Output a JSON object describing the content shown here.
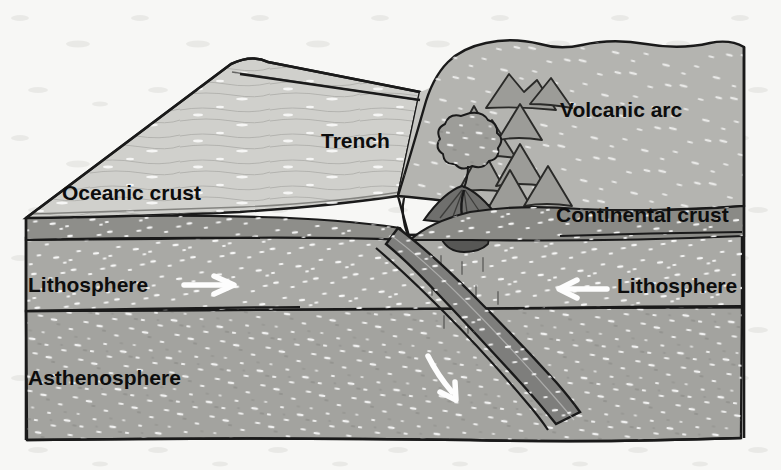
{
  "figure": {
    "background_color": "#f7f7f5"
  },
  "palette": {
    "paper": "#f7f7f5",
    "ocean_water": "#d9d9d6",
    "oceanic_top": "#bdbdb9",
    "oceanic_crust_band": "#8e8e8a",
    "lithosphere": "#a9a9a5",
    "asthenosphere": "#a3a39f",
    "continental_top": "#b2b2ae",
    "continental_crust_band": "#8a8a86",
    "slab_band": "#828280",
    "mountain_fill": "#9c9c98",
    "volcano_cone": "#6e6e6c",
    "magma_chamber": "#565654",
    "ash_plume": "#9a9a96",
    "outline": "#1a1a1a",
    "arrow_white": "#fdfdfd",
    "label_text": "#0d0d0d"
  },
  "labels": [
    {
      "id": "oceanic-crust",
      "text": "Oceanic crust",
      "x": 62,
      "y": 200,
      "size": 21
    },
    {
      "id": "trench",
      "text": "Trench",
      "x": 321,
      "y": 148,
      "size": 21
    },
    {
      "id": "volcanic-arc",
      "text": "Volcanic arc",
      "x": 560,
      "y": 117,
      "size": 21
    },
    {
      "id": "continental-crust",
      "text": "Continental crust",
      "x": 556,
      "y": 222,
      "size": 21
    },
    {
      "id": "lithosphere-left",
      "text": "Lithosphere",
      "x": 28,
      "y": 292,
      "size": 21
    },
    {
      "id": "lithosphere-right",
      "text": "Lithosphere",
      "x": 617,
      "y": 293,
      "size": 21
    },
    {
      "id": "asthenosphere",
      "text": "Asthenosphere",
      "x": 28,
      "y": 385,
      "size": 21
    }
  ],
  "arrows": [
    {
      "id": "oceanic-plate-motion",
      "direction": "right",
      "meaning": "oceanic lithosphere moves right",
      "x1": 184,
      "y1": 285,
      "x2": 232,
      "y2": 285
    },
    {
      "id": "continental-plate-motion",
      "direction": "left",
      "meaning": "continental lithosphere moves left",
      "x1": 607,
      "y1": 289,
      "x2": 561,
      "y2": 289
    },
    {
      "id": "slab-descent",
      "direction": "down-right",
      "meaning": "subducting slab descends",
      "x1": 430,
      "y1": 358,
      "x2": 458,
      "y2": 398
    }
  ],
  "features": {
    "volcano": {
      "id": "arc-volcano",
      "summit_x": 466,
      "summit_y": 188,
      "has_ash_plume": true,
      "has_magma_chamber": true
    },
    "ash_plume": {
      "id": "ash-plume",
      "cx": 470,
      "cy": 141,
      "r": 26
    },
    "magma_chamber": {
      "id": "magma-chamber",
      "cx": 463,
      "cy": 218,
      "rx": 23,
      "ry": 9
    },
    "trench_notch": {
      "id": "trench-notch",
      "x": 398,
      "y": 196
    },
    "mountain_rows": 4,
    "mountains_total": 11
  },
  "layers": [
    {
      "id": "ocean-water",
      "name": "Ocean water",
      "color": "#d9d9d6"
    },
    {
      "id": "oceanic-crust",
      "name": "Oceanic crust",
      "color": "#8e8e8a"
    },
    {
      "id": "oceanic-lithosphere",
      "name": "Lithosphere",
      "color": "#a9a9a5"
    },
    {
      "id": "asthenosphere",
      "name": "Asthenosphere",
      "color": "#a3a39f"
    },
    {
      "id": "continental-crust",
      "name": "Continental crust",
      "color": "#8a8a86"
    },
    {
      "id": "subducting-slab",
      "name": "Subducting slab",
      "color": "#828280"
    }
  ]
}
